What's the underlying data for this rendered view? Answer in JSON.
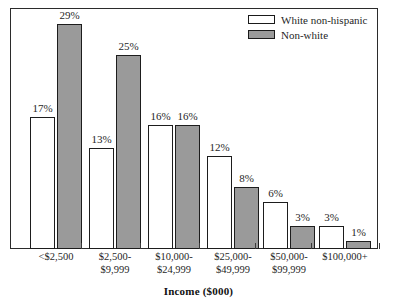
{
  "chart_data": {
    "type": "bar",
    "title": "",
    "xlabel": "Income ($000)",
    "ylabel": "",
    "ylim": [
      0,
      31
    ],
    "grid": false,
    "legend_position": "top-right",
    "value_suffix": "%",
    "categories": [
      "<$2,500",
      "$2,500-\n$9,999",
      "$10,000-\n$24,999",
      "$25,000-\n$49,999",
      "$50,000-\n$99,999",
      "$100,000+"
    ],
    "category_lines": [
      [
        "<$2,500"
      ],
      [
        "$2,500-",
        "$9,999"
      ],
      [
        "$10,000-",
        "$24,999"
      ],
      [
        "$25,000-",
        "$49,999"
      ],
      [
        "$50,000-",
        "$99,999"
      ],
      [
        "$100,000+"
      ]
    ],
    "series": [
      {
        "name": "White non-hispanic",
        "color": "#ffffff",
        "values": [
          17,
          13,
          16,
          12,
          6,
          3
        ],
        "labels": [
          "17%",
          "13%",
          "16%",
          "12%",
          "6%",
          "3%"
        ]
      },
      {
        "name": "Non-white",
        "color": "#9a9a9a",
        "values": [
          29,
          25,
          16,
          8,
          3,
          1
        ],
        "labels": [
          "29%",
          "25%",
          "16%",
          "8%",
          "3%",
          "1%"
        ]
      }
    ]
  },
  "legend": {
    "items": [
      {
        "label": "White non-hispanic",
        "swatch": "white"
      },
      {
        "label": "Non-white",
        "swatch": "gray"
      }
    ]
  },
  "axis": {
    "title": "Income ($000)"
  },
  "colors": {
    "bar_white": "#ffffff",
    "bar_gray": "#9a9a9a",
    "outline": "#1d1d1d",
    "frame": "#2b2b2b",
    "text": "#1f1f1f",
    "background": "#ffffff"
  }
}
